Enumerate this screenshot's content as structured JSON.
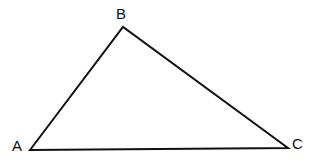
{
  "figure": {
    "name": "Triangle ABC",
    "background_color": "#ffffff",
    "stroke_color": "#111111",
    "stroke_width": 2,
    "width": 315,
    "height": 162,
    "vertices": [
      {
        "id": "A",
        "label": "A",
        "x": 30,
        "y": 150,
        "label_x": 12,
        "label_y": 138
      },
      {
        "id": "B",
        "label": "B",
        "x": 123,
        "y": 27,
        "label_x": 116,
        "label_y": 6
      },
      {
        "id": "C",
        "label": "C",
        "x": 288,
        "y": 148,
        "label_x": 292,
        "label_y": 136
      }
    ],
    "edges": [
      {
        "id": "AB",
        "from": "A",
        "to": "B"
      },
      {
        "id": "BC",
        "from": "B",
        "to": "C"
      },
      {
        "id": "CA",
        "from": "C",
        "to": "A"
      }
    ],
    "polygon_points": "30,150 123,27 288,148"
  }
}
